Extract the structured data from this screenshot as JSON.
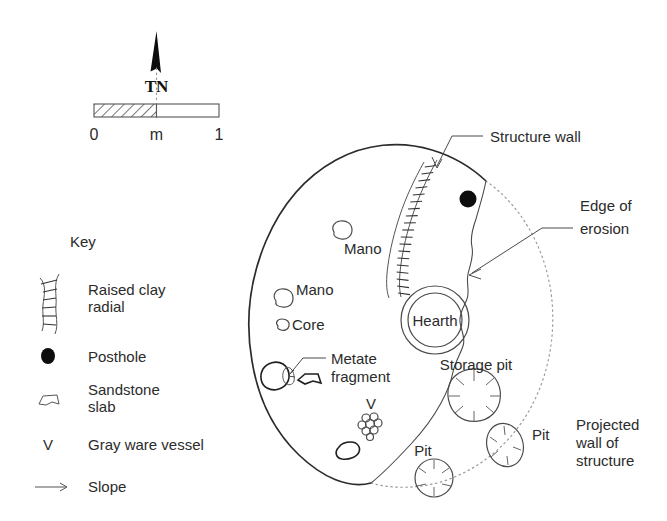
{
  "figure": {
    "background": "#ffffff",
    "ink": "#2b2b2b"
  },
  "north_arrow": {
    "label": "TN",
    "name": "true-north-arrow"
  },
  "scale_bar": {
    "unit_label": "m",
    "min_label": "0",
    "max_label": "1",
    "hatched_half": "left"
  },
  "key": {
    "title": "Key",
    "items": [
      {
        "symbol": "raised-clay-radial-symbol",
        "label": "Raised clay\nradial",
        "line1": "Raised clay",
        "line2": "radial"
      },
      {
        "symbol": "posthole-symbol",
        "label": "Posthole",
        "line1": "Posthole",
        "line2": ""
      },
      {
        "symbol": "sandstone-slab-symbol",
        "label": "Sandstone\nslab",
        "line1": "Sandstone",
        "line2": "slab"
      },
      {
        "symbol": "gray-ware-vessel-symbol",
        "label": "Gray ware vessel",
        "line1": "Gray ware vessel",
        "line2": "",
        "glyph": "V"
      },
      {
        "symbol": "slope-arrow-symbol",
        "label": "Slope",
        "line1": "Slope",
        "line2": ""
      }
    ]
  },
  "callouts": [
    {
      "name": "callout-structure-wall",
      "line1": "Structure wall",
      "line2": ""
    },
    {
      "name": "callout-edge-of-erosion",
      "line1": "Edge of",
      "line2": "erosion"
    },
    {
      "name": "callout-projected-wall",
      "line1": "Projected",
      "line2": "wall of",
      "line3": "structure"
    },
    {
      "name": "callout-metate-fragment",
      "line1": "Metate",
      "line2": "fragment"
    }
  ],
  "map_labels": {
    "hearth": "Hearth",
    "mano_upper": "Mano",
    "mano_lower": "Mano",
    "core": "Core",
    "vessel_marker": "V",
    "storage_pit": "Storage pit",
    "pit_right": "Pit",
    "pit_left": "Pit"
  }
}
